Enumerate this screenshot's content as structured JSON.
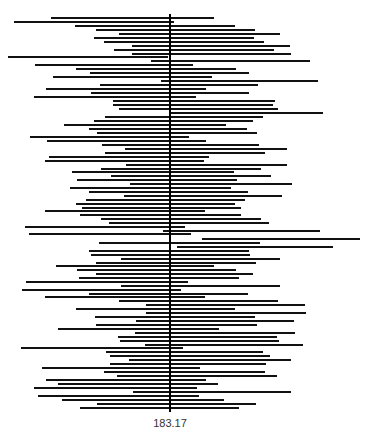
{
  "chart_data": {
    "type": "interval",
    "title": "",
    "xlabel": "",
    "ylabel": "",
    "reference_value": 183.17,
    "reference_label": "183.17",
    "reference_x_px": 170,
    "reference_y_range_px": [
      14,
      412
    ],
    "grid": false,
    "legend": null,
    "line_color": "#111111",
    "reference_color": "#000000",
    "note": "Stacked horizontal confidence intervals (pixel x-coordinates, left/right) around a vertical reference line at 183.17; no numeric axis shown.",
    "intervals": [
      {
        "y": 18,
        "left": 51,
        "right": 214
      },
      {
        "y": 22,
        "left": 14,
        "right": 174
      },
      {
        "y": 26,
        "left": 75,
        "right": 235
      },
      {
        "y": 30,
        "left": 96,
        "right": 255
      },
      {
        "y": 34,
        "left": 119,
        "right": 280
      },
      {
        "y": 38,
        "left": 94,
        "right": 254
      },
      {
        "y": 42,
        "left": 104,
        "right": 264
      },
      {
        "y": 46,
        "left": 132,
        "right": 290
      },
      {
        "y": 50,
        "left": 114,
        "right": 274
      },
      {
        "y": 54,
        "left": 132,
        "right": 291
      },
      {
        "y": 57,
        "left": 8,
        "right": 168
      },
      {
        "y": 61,
        "left": 151,
        "right": 310
      },
      {
        "y": 65,
        "left": 35,
        "right": 193
      },
      {
        "y": 69,
        "left": 76,
        "right": 236
      },
      {
        "y": 73,
        "left": 90,
        "right": 249
      },
      {
        "y": 77,
        "left": 53,
        "right": 212
      },
      {
        "y": 81,
        "left": 161,
        "right": 318
      },
      {
        "y": 85,
        "left": 100,
        "right": 258
      },
      {
        "y": 89,
        "left": 46,
        "right": 206
      },
      {
        "y": 93,
        "left": 91,
        "right": 249
      },
      {
        "y": 97,
        "left": 34,
        "right": 196
      },
      {
        "y": 101,
        "left": 113,
        "right": 275
      },
      {
        "y": 105,
        "left": 113,
        "right": 273
      },
      {
        "y": 109,
        "left": 119,
        "right": 278
      },
      {
        "y": 113,
        "left": 171,
        "right": 323
      },
      {
        "y": 117,
        "left": 105,
        "right": 263
      },
      {
        "y": 121,
        "left": 94,
        "right": 253
      },
      {
        "y": 125,
        "left": 64,
        "right": 226
      },
      {
        "y": 129,
        "left": 89,
        "right": 247
      },
      {
        "y": 133,
        "left": 97,
        "right": 257
      },
      {
        "y": 137,
        "left": 30,
        "right": 189
      },
      {
        "y": 141,
        "left": 47,
        "right": 206
      },
      {
        "y": 145,
        "left": 102,
        "right": 259
      },
      {
        "y": 149,
        "left": 125,
        "right": 287
      },
      {
        "y": 153,
        "left": 105,
        "right": 265
      },
      {
        "y": 157,
        "left": 49,
        "right": 209
      },
      {
        "y": 161,
        "left": 45,
        "right": 204
      },
      {
        "y": 165,
        "left": 126,
        "right": 287
      },
      {
        "y": 169,
        "left": 101,
        "right": 261
      },
      {
        "y": 172,
        "left": 72,
        "right": 234
      },
      {
        "y": 176,
        "left": 111,
        "right": 271
      },
      {
        "y": 180,
        "left": 77,
        "right": 237
      },
      {
        "y": 184,
        "left": 130,
        "right": 292
      },
      {
        "y": 188,
        "left": 70,
        "right": 231
      },
      {
        "y": 192,
        "left": 89,
        "right": 248
      },
      {
        "y": 196,
        "left": 124,
        "right": 282
      },
      {
        "y": 200,
        "left": 86,
        "right": 245
      },
      {
        "y": 204,
        "left": 76,
        "right": 235
      },
      {
        "y": 208,
        "left": 82,
        "right": 241
      },
      {
        "y": 211,
        "left": 45,
        "right": 205
      },
      {
        "y": 215,
        "left": 80,
        "right": 241
      },
      {
        "y": 219,
        "left": 101,
        "right": 261
      },
      {
        "y": 223,
        "left": 109,
        "right": 269
      },
      {
        "y": 227,
        "left": 25,
        "right": 185
      },
      {
        "y": 231,
        "left": 163,
        "right": 320
      },
      {
        "y": 234,
        "left": 29,
        "right": 191
      },
      {
        "y": 239,
        "left": 202,
        "right": 360
      },
      {
        "y": 243,
        "left": 99,
        "right": 260
      },
      {
        "y": 247,
        "left": 177,
        "right": 333
      },
      {
        "y": 251,
        "left": 89,
        "right": 249
      },
      {
        "y": 255,
        "left": 91,
        "right": 250
      },
      {
        "y": 259,
        "left": 121,
        "right": 280
      },
      {
        "y": 263,
        "left": 96,
        "right": 256
      },
      {
        "y": 266,
        "left": 56,
        "right": 214
      },
      {
        "y": 270,
        "left": 77,
        "right": 236
      },
      {
        "y": 274,
        "left": 96,
        "right": 253
      },
      {
        "y": 278,
        "left": 79,
        "right": 239
      },
      {
        "y": 282,
        "left": 26,
        "right": 188
      },
      {
        "y": 286,
        "left": 121,
        "right": 280
      },
      {
        "y": 290,
        "left": 22,
        "right": 181
      },
      {
        "y": 294,
        "left": 89,
        "right": 248
      },
      {
        "y": 297,
        "left": 45,
        "right": 205
      },
      {
        "y": 301,
        "left": 119,
        "right": 278
      },
      {
        "y": 305,
        "left": 146,
        "right": 305
      },
      {
        "y": 309,
        "left": 76,
        "right": 235
      },
      {
        "y": 313,
        "left": 146,
        "right": 306
      },
      {
        "y": 317,
        "left": 95,
        "right": 255
      },
      {
        "y": 321,
        "left": 136,
        "right": 294
      },
      {
        "y": 325,
        "left": 96,
        "right": 257
      },
      {
        "y": 329,
        "left": 58,
        "right": 219
      },
      {
        "y": 333,
        "left": 135,
        "right": 295
      },
      {
        "y": 337,
        "left": 118,
        "right": 277
      },
      {
        "y": 341,
        "left": 120,
        "right": 279
      },
      {
        "y": 345,
        "left": 145,
        "right": 303
      },
      {
        "y": 348,
        "left": 21,
        "right": 183
      },
      {
        "y": 352,
        "left": 106,
        "right": 263
      },
      {
        "y": 356,
        "left": 110,
        "right": 270
      },
      {
        "y": 360,
        "left": 129,
        "right": 291
      },
      {
        "y": 364,
        "left": 110,
        "right": 266
      },
      {
        "y": 368,
        "left": 42,
        "right": 200
      },
      {
        "y": 372,
        "left": 104,
        "right": 265
      },
      {
        "y": 376,
        "left": 117,
        "right": 277
      },
      {
        "y": 380,
        "left": 46,
        "right": 206
      },
      {
        "y": 384,
        "left": 58,
        "right": 218
      },
      {
        "y": 388,
        "left": 34,
        "right": 197
      },
      {
        "y": 392,
        "left": 133,
        "right": 291
      },
      {
        "y": 396,
        "left": 38,
        "right": 199
      },
      {
        "y": 400,
        "left": 62,
        "right": 224
      },
      {
        "y": 404,
        "left": 97,
        "right": 256
      },
      {
        "y": 408,
        "left": 80,
        "right": 239
      }
    ]
  }
}
